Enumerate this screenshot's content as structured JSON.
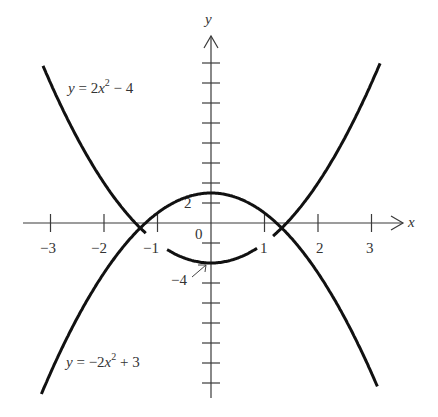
{
  "chart_data": {
    "type": "line",
    "title": "",
    "xlabel": "x",
    "ylabel": "y",
    "xlim": [
      -3.5,
      3.6
    ],
    "ylim": [
      -17,
      18
    ],
    "grid": false,
    "x_ticks": [
      -3,
      -2,
      -1,
      1,
      2,
      3
    ],
    "x_tick_labels": [
      "−3",
      "−2",
      "−1",
      "1",
      "2",
      "3"
    ],
    "y_ticks_step": 2,
    "y_tick_labels": [
      {
        "value": 2,
        "text": "2"
      },
      {
        "value": -4,
        "text": "−4"
      }
    ],
    "origin_label": "0",
    "series": [
      {
        "name": "y = 2x^2 - 4",
        "label_parts": {
          "lhs": "y",
          "eq": " = 2",
          "var": "x",
          "sup": "2",
          "rest": " − 4"
        },
        "expression": "2*x^2 - 4",
        "x_range": [
          -3.14,
          3.16
        ],
        "gaps": [
          [
            -1.2,
            -0.82
          ],
          [
            0.88,
            1.15
          ]
        ],
        "points": [
          [
            -3,
            14
          ],
          [
            -2,
            4
          ],
          [
            -1.5,
            0.5
          ],
          [
            -1,
            -2
          ],
          [
            0,
            -4
          ],
          [
            1,
            -2
          ],
          [
            1.5,
            0.5
          ],
          [
            2,
            4
          ],
          [
            3,
            14
          ]
        ]
      },
      {
        "name": "y = -2x^2 + 3",
        "label_parts": {
          "lhs": "y",
          "eq": " = −2",
          "var": "x",
          "sup": "2",
          "rest": " + 3"
        },
        "expression": "-2*x^2 + 3",
        "x_range": [
          -3.17,
          3.12
        ],
        "gaps": [],
        "points": [
          [
            -3,
            -15
          ],
          [
            -2,
            -5
          ],
          [
            -1.5,
            -1.5
          ],
          [
            -1,
            1
          ],
          [
            0,
            3
          ],
          [
            1,
            1
          ],
          [
            1.5,
            -1.5
          ],
          [
            2,
            -5
          ],
          [
            3,
            -15
          ]
        ]
      }
    ],
    "intersections": [
      [
        -1.323,
        -0.5
      ],
      [
        1.323,
        -0.5
      ]
    ],
    "annotations": [
      {
        "text": "−4",
        "points_to": [
          0,
          -4
        ],
        "arrow": true
      }
    ]
  },
  "axes": {
    "x_label": "x",
    "y_label": "y",
    "origin": "0"
  },
  "labels": {
    "upper_eq": {
      "lhs": "y",
      "eq": " = 2",
      "var": "x",
      "sup": "2",
      "rest": " − 4"
    },
    "lower_eq": {
      "lhs": "y",
      "eq": " = −2",
      "var": "x",
      "sup": "2",
      "rest": " + 3"
    },
    "y_tick_2": "2",
    "y_tick_neg4": "−4",
    "x_ticks": [
      "−3",
      "−2",
      "−1",
      "1",
      "2",
      "3"
    ]
  }
}
